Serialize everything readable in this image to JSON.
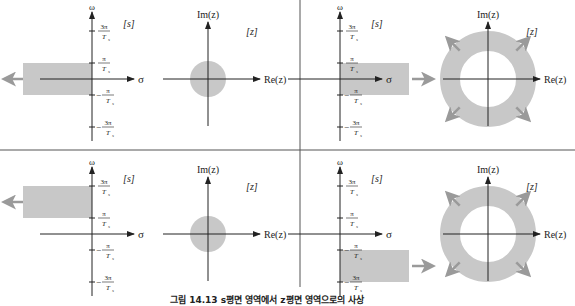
{
  "caption": "그림 14.13  s평면 영역에서 z평면 영역으로의 사상",
  "colors": {
    "region": "#c8c8c8",
    "arrow": "#9a9a9a",
    "axis": "#222222",
    "divider": "#555555"
  },
  "s_plane": {
    "tag": "[s]",
    "omega_label": "ω",
    "sigma_label": "σ",
    "ticks": [
      {
        "num": "3π",
        "den": "Ts",
        "sign": "",
        "value": 3
      },
      {
        "num": "π",
        "den": "Ts",
        "sign": "",
        "value": 1
      },
      {
        "num": "π",
        "den": "Ts",
        "sign": "−",
        "value": -1
      },
      {
        "num": "3π",
        "den": "Ts",
        "sign": "−",
        "value": -3
      }
    ]
  },
  "z_plane": {
    "tag": "[z]",
    "im_label": "Im(z)",
    "re_label": "Re(z)"
  },
  "panels": [
    {
      "id": "top-left",
      "strip": [
        -1,
        1
      ],
      "direction": "left",
      "z_region": "disk"
    },
    {
      "id": "top-right",
      "strip": [
        -1,
        1
      ],
      "direction": "right",
      "z_region": "annulus"
    },
    {
      "id": "bottom-left",
      "strip": [
        1,
        3
      ],
      "direction": "left",
      "z_region": "disk"
    },
    {
      "id": "bottom-right",
      "strip": [
        -3,
        -1
      ],
      "direction": "right",
      "z_region": "annulus"
    }
  ]
}
